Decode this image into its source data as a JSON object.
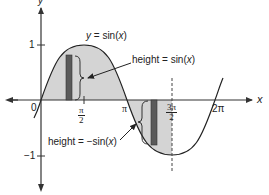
{
  "figure": {
    "curve_label": {
      "prefix": "y = sin(",
      "var": "x",
      "suffix": ")"
    },
    "annotation_positive": {
      "prefix": "height = sin(",
      "var": "x",
      "suffix": ")"
    },
    "annotation_negative": {
      "prefix": "height = −sin(",
      "var": "x",
      "suffix": ")"
    },
    "axes": {
      "x_label": "x",
      "y_label": "y",
      "origin_label": "0",
      "y_ticks": [
        {
          "label": "1",
          "value": 1
        },
        {
          "label": "−1",
          "value": -1
        }
      ],
      "x_ticks": [
        {
          "num": "π",
          "den": "2",
          "value": "pi/2"
        },
        {
          "label": "π",
          "value": "pi"
        },
        {
          "num": "3π",
          "den": "2",
          "value": "3pi/2"
        },
        {
          "label": "2π",
          "value": "2pi"
        }
      ]
    },
    "colors": {
      "curve": "#222222",
      "shaded_area": "#d4d4d4",
      "rectangle": "#5a5a5a",
      "axes": "#333333"
    }
  }
}
